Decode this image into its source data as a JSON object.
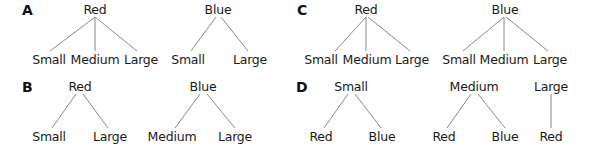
{
  "panels": [
    {
      "letter": "A",
      "trees": [
        {
          "root": "Red",
          "children": [
            "Small",
            "Medium",
            "Large"
          ]
        },
        {
          "root": "Blue",
          "children": [
            "Small",
            "Large"
          ]
        }
      ]
    },
    {
      "letter": "B",
      "trees": [
        {
          "root": "Red",
          "children": [
            "Small",
            "Large"
          ]
        },
        {
          "root": "Blue",
          "children": [
            "Medium",
            "Large"
          ]
        }
      ]
    },
    {
      "letter": "C",
      "trees": [
        {
          "root": "Red",
          "children": [
            "Small",
            "Medium",
            "Large"
          ]
        },
        {
          "root": "Blue",
          "children": [
            "Small",
            "Medium",
            "Large"
          ]
        }
      ]
    },
    {
      "letter": "D",
      "trees": [
        {
          "root": "Small",
          "children": [
            "Red",
            "Blue"
          ]
        },
        {
          "root": "Medium",
          "children": [
            "Red",
            "Blue"
          ]
        },
        {
          "root": "Large",
          "children": [
            "Red"
          ]
        }
      ]
    }
  ],
  "colors": {
    "edge": "#8a8a8a",
    "text": "#1a1a1a"
  }
}
